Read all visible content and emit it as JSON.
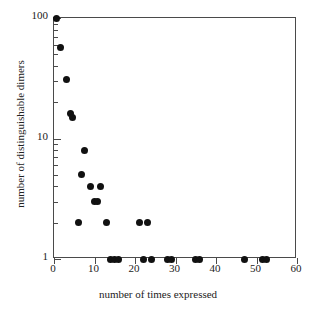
{
  "chart_data": {
    "type": "scatter",
    "title": "",
    "xlabel": "number of times expressed",
    "ylabel": "number of distinguishable dimers",
    "xlim": [
      0,
      60
    ],
    "ylim": [
      1,
      100
    ],
    "yscale": "log",
    "xscale": "linear",
    "grid": false,
    "legend": null,
    "xticks": [
      0,
      10,
      20,
      30,
      40,
      50,
      60
    ],
    "xtick_labels": [
      "0",
      "10",
      "20",
      "30",
      "40",
      "50",
      "60"
    ],
    "yticks": [
      1,
      10,
      100
    ],
    "ytick_labels": [
      "1",
      "10",
      "100"
    ],
    "marker": "filled-circle",
    "marker_color": "#111111",
    "points": [
      {
        "x": 0.5,
        "y": 100
      },
      {
        "x": 1.5,
        "y": 57
      },
      {
        "x": 3,
        "y": 31
      },
      {
        "x": 4,
        "y": 16
      },
      {
        "x": 4.6,
        "y": 15
      },
      {
        "x": 7.5,
        "y": 8
      },
      {
        "x": 6.7,
        "y": 5
      },
      {
        "x": 9,
        "y": 4
      },
      {
        "x": 11.5,
        "y": 4
      },
      {
        "x": 10,
        "y": 3
      },
      {
        "x": 10.8,
        "y": 3
      },
      {
        "x": 6,
        "y": 2
      },
      {
        "x": 13,
        "y": 2
      },
      {
        "x": 21,
        "y": 2
      },
      {
        "x": 23,
        "y": 2
      },
      {
        "x": 14,
        "y": 1
      },
      {
        "x": 15,
        "y": 1
      },
      {
        "x": 16,
        "y": 1
      },
      {
        "x": 22,
        "y": 1
      },
      {
        "x": 24,
        "y": 1
      },
      {
        "x": 28,
        "y": 1
      },
      {
        "x": 29,
        "y": 1
      },
      {
        "x": 35,
        "y": 1
      },
      {
        "x": 36,
        "y": 1
      },
      {
        "x": 47,
        "y": 1
      },
      {
        "x": 51.5,
        "y": 1
      },
      {
        "x": 52.5,
        "y": 1
      }
    ]
  },
  "axis": {
    "y_minor_ticks": [
      2,
      3,
      4,
      5,
      6,
      7,
      8,
      9,
      20,
      30,
      40,
      50,
      60,
      70,
      80,
      90
    ]
  }
}
